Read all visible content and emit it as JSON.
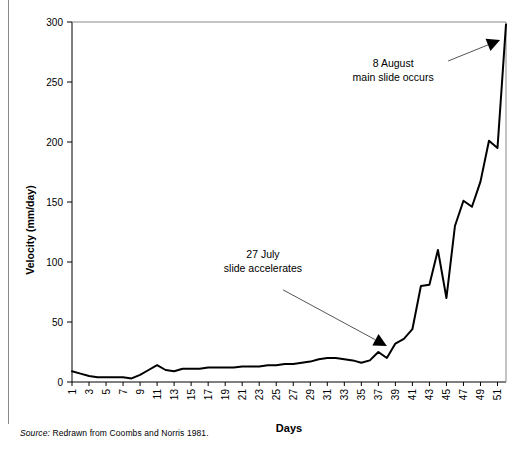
{
  "figure": {
    "source_label": "Source:",
    "source_text": "Redrawn from Coombs and Norris 1981."
  },
  "chart_data": {
    "type": "line",
    "title": "",
    "subtitle": "",
    "xlabel": "Days",
    "ylabel": "Velocity (mm/day)",
    "xlim": [
      1,
      52
    ],
    "ylim": [
      0,
      300
    ],
    "grid": false,
    "legend": "none",
    "line_color": "#000000",
    "line_width": 2,
    "y_ticks": [
      0,
      50,
      100,
      150,
      200,
      250,
      300
    ],
    "y_tick_labels": [
      "0",
      "50",
      "100",
      "150",
      "200",
      "250",
      "300"
    ],
    "x_ticks": [
      1,
      3,
      5,
      7,
      9,
      11,
      13,
      15,
      17,
      19,
      21,
      23,
      25,
      27,
      29,
      31,
      33,
      35,
      37,
      39,
      41,
      43,
      45,
      47,
      49,
      51
    ],
    "x_tick_labels": [
      "1",
      "3",
      "5",
      "7",
      "9",
      "11",
      "13",
      "15",
      "17",
      "19",
      "21",
      "23",
      "25",
      "27",
      "29",
      "31",
      "33",
      "35",
      "37",
      "39",
      "41",
      "43",
      "45",
      "47",
      "49",
      "51"
    ],
    "x_tick_rotation": 90,
    "x": [
      1,
      2,
      3,
      4,
      5,
      6,
      7,
      8,
      9,
      10,
      11,
      12,
      13,
      14,
      15,
      16,
      17,
      18,
      19,
      20,
      21,
      22,
      23,
      24,
      25,
      26,
      27,
      28,
      29,
      30,
      31,
      32,
      33,
      34,
      35,
      36,
      37,
      38,
      39,
      40,
      41,
      42,
      43,
      44,
      45,
      46,
      47,
      48,
      49,
      50,
      51,
      52
    ],
    "values": [
      9,
      7,
      5,
      4,
      4,
      4,
      4,
      3,
      6,
      10,
      14,
      10,
      9,
      11,
      11,
      11,
      12,
      12,
      12,
      12,
      13,
      13,
      13,
      14,
      14,
      15,
      15,
      16,
      17,
      19,
      20,
      20,
      19,
      18,
      16,
      18,
      25,
      20,
      32,
      36,
      44,
      80,
      81,
      110,
      70,
      130,
      151,
      146,
      167,
      201,
      195,
      298
    ],
    "series": [
      {
        "name": "Velocity",
        "values": [
          9,
          7,
          5,
          4,
          4,
          4,
          4,
          3,
          6,
          10,
          14,
          10,
          9,
          11,
          11,
          11,
          12,
          12,
          12,
          12,
          13,
          13,
          13,
          14,
          14,
          15,
          15,
          16,
          17,
          19,
          20,
          20,
          19,
          18,
          16,
          18,
          25,
          20,
          32,
          36,
          44,
          80,
          81,
          110,
          70,
          130,
          151,
          146,
          167,
          201,
          195,
          298
        ]
      }
    ],
    "annotations": [
      {
        "id": "main-slide",
        "line1": "8 August",
        "line2": "main slide occurs",
        "text_x": 0.74,
        "text_y": 0.875,
        "arrow_target_day": 51.3,
        "arrow_target_value": 285
      },
      {
        "id": "slide-accelerates",
        "line1": "27 July",
        "line2": "slide accelerates",
        "text_x": 0.44,
        "text_y": 0.345,
        "arrow_target_day": 38.0,
        "arrow_target_value": 30
      }
    ]
  }
}
